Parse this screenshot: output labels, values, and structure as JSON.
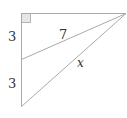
{
  "diagram": {
    "type": "geometry-right-triangle",
    "labels": {
      "upper_segment": "3",
      "lower_segment": "3",
      "inner_hypotenuse": "7",
      "outer_hypotenuse": "x"
    },
    "colors": {
      "line": "#aaaaaa",
      "right_angle_fill": "#e6e6e6",
      "right_angle_stroke": "#b4b4b4",
      "text": "#333333"
    }
  }
}
